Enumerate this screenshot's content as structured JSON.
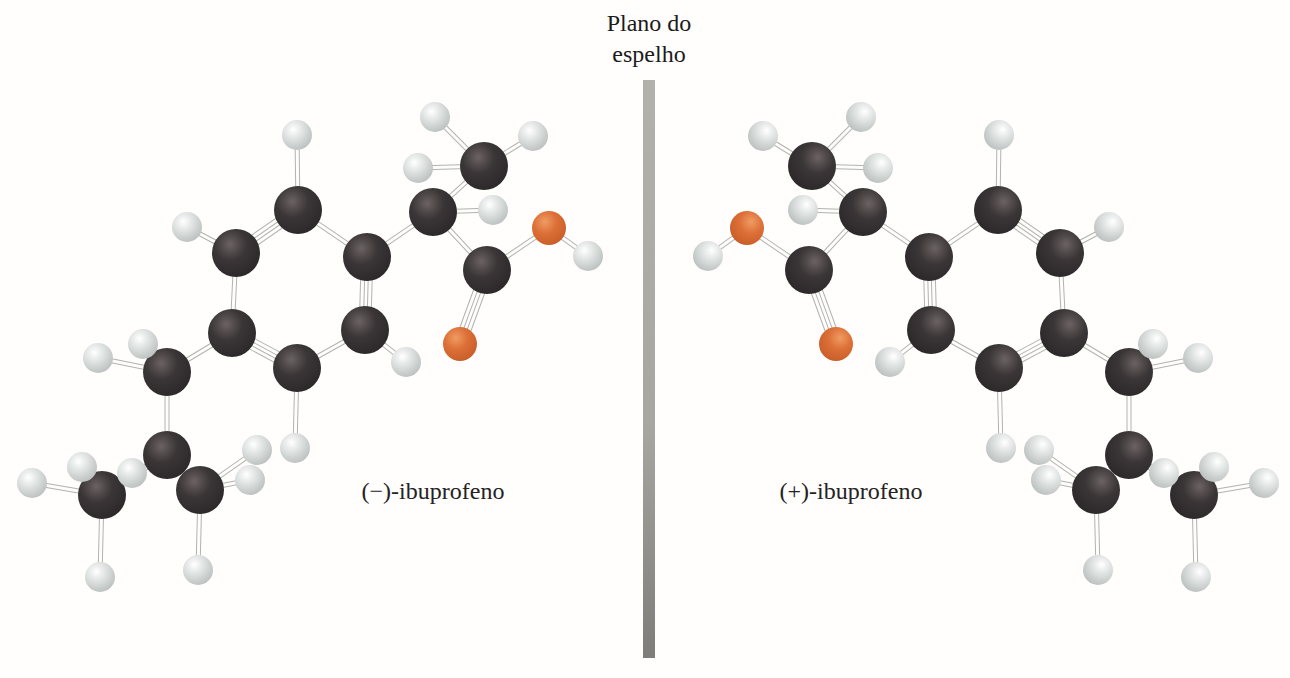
{
  "title": {
    "line1": "Plano do",
    "line2": "espelho"
  },
  "labels": {
    "left": "(−)-ibuprofeno",
    "right": "(+)-ibuprofeno"
  },
  "palette": {
    "background": "#fffefd",
    "carbon_hi": "#6b6263",
    "carbon_mid": "#3a3536",
    "carbon_edge": "#2b2728",
    "hydrogen_hi": "#ffffff",
    "hydrogen_mid": "#dde1e0",
    "hydrogen_edge": "#b8bebd",
    "oxygen_hi": "#ef9c63",
    "oxygen_mid": "#dd7038",
    "oxygen_edge": "#c75c27",
    "bond_outline": "#b2b2ae",
    "bond_fill": "#fdfdfc",
    "bar_top": "#b2b2ad",
    "bar_mid": "#a7a7a2",
    "bar_bottom": "#7d7d79",
    "text": "#1c1a1a"
  },
  "mirror_bar": {
    "x": 643,
    "y_top": 80,
    "y_bottom": 658,
    "width": 12
  },
  "mirror_axis_x": 648,
  "molecule": {
    "name": "ibuprofeno",
    "radii": {
      "C": 24,
      "H": 15,
      "O": 17
    },
    "atoms": [
      {
        "id": "C1",
        "el": "C",
        "x": 298,
        "y": 210
      },
      {
        "id": "C2",
        "el": "C",
        "x": 236,
        "y": 253
      },
      {
        "id": "C3",
        "el": "C",
        "x": 232,
        "y": 333
      },
      {
        "id": "C4",
        "el": "C",
        "x": 297,
        "y": 368
      },
      {
        "id": "C5",
        "el": "C",
        "x": 365,
        "y": 330
      },
      {
        "id": "C6",
        "el": "C",
        "x": 367,
        "y": 257
      },
      {
        "id": "C7",
        "el": "C",
        "x": 433,
        "y": 212
      },
      {
        "id": "C8",
        "el": "C",
        "x": 484,
        "y": 166
      },
      {
        "id": "C9",
        "el": "C",
        "x": 487,
        "y": 270
      },
      {
        "id": "C10",
        "el": "C",
        "x": 167,
        "y": 372
      },
      {
        "id": "C11",
        "el": "C",
        "x": 167,
        "y": 455
      },
      {
        "id": "C12",
        "el": "C",
        "x": 102,
        "y": 495
      },
      {
        "id": "C13",
        "el": "C",
        "x": 200,
        "y": 490
      },
      {
        "id": "O1",
        "el": "O",
        "x": 549,
        "y": 228
      },
      {
        "id": "O2",
        "el": "O",
        "x": 460,
        "y": 344
      },
      {
        "id": "H1",
        "el": "H",
        "x": 297,
        "y": 135
      },
      {
        "id": "H2",
        "el": "H",
        "x": 187,
        "y": 227
      },
      {
        "id": "H3",
        "el": "H",
        "x": 295,
        "y": 448
      },
      {
        "id": "H4",
        "el": "H",
        "x": 406,
        "y": 362
      },
      {
        "id": "H5",
        "el": "H",
        "x": 493,
        "y": 210
      },
      {
        "id": "H6",
        "el": "H",
        "x": 435,
        "y": 117
      },
      {
        "id": "H7",
        "el": "H",
        "x": 533,
        "y": 136
      },
      {
        "id": "H8",
        "el": "H",
        "x": 418,
        "y": 168
      },
      {
        "id": "H9",
        "el": "H",
        "x": 588,
        "y": 256
      },
      {
        "id": "H10",
        "el": "H",
        "x": 143,
        "y": 344
      },
      {
        "id": "H11",
        "el": "H",
        "x": 98,
        "y": 358
      },
      {
        "id": "H12",
        "el": "H",
        "x": 132,
        "y": 473
      },
      {
        "id": "H13",
        "el": "H",
        "x": 82,
        "y": 467
      },
      {
        "id": "H14",
        "el": "H",
        "x": 32,
        "y": 483
      },
      {
        "id": "H15",
        "el": "H",
        "x": 100,
        "y": 577
      },
      {
        "id": "H16",
        "el": "H",
        "x": 257,
        "y": 450
      },
      {
        "id": "H17",
        "el": "H",
        "x": 250,
        "y": 480
      },
      {
        "id": "H18",
        "el": "H",
        "x": 198,
        "y": 570
      }
    ],
    "bonds": [
      {
        "a": "C1",
        "b": "C2",
        "order": 2
      },
      {
        "a": "C2",
        "b": "C3",
        "order": 1
      },
      {
        "a": "C3",
        "b": "C4",
        "order": 2
      },
      {
        "a": "C4",
        "b": "C5",
        "order": 1
      },
      {
        "a": "C5",
        "b": "C6",
        "order": 2
      },
      {
        "a": "C6",
        "b": "C1",
        "order": 1
      },
      {
        "a": "C1",
        "b": "H1",
        "order": 1
      },
      {
        "a": "C2",
        "b": "H2",
        "order": 1
      },
      {
        "a": "C4",
        "b": "H3",
        "order": 1
      },
      {
        "a": "C5",
        "b": "H4",
        "order": 1
      },
      {
        "a": "C6",
        "b": "C7",
        "order": 1
      },
      {
        "a": "C7",
        "b": "C8",
        "order": 1
      },
      {
        "a": "C7",
        "b": "H5",
        "order": 1
      },
      {
        "a": "C7",
        "b": "C9",
        "order": 1
      },
      {
        "a": "C8",
        "b": "H6",
        "order": 1
      },
      {
        "a": "C8",
        "b": "H7",
        "order": 1
      },
      {
        "a": "C8",
        "b": "H8",
        "order": 1
      },
      {
        "a": "C9",
        "b": "O2",
        "order": 2
      },
      {
        "a": "C9",
        "b": "O1",
        "order": 1
      },
      {
        "a": "O1",
        "b": "H9",
        "order": 1
      },
      {
        "a": "C3",
        "b": "C10",
        "order": 1
      },
      {
        "a": "C10",
        "b": "H10",
        "order": 1
      },
      {
        "a": "C10",
        "b": "H11",
        "order": 1
      },
      {
        "a": "C10",
        "b": "C11",
        "order": 1
      },
      {
        "a": "C11",
        "b": "H12",
        "order": 1
      },
      {
        "a": "C11",
        "b": "C12",
        "order": 1
      },
      {
        "a": "C11",
        "b": "C13",
        "order": 1
      },
      {
        "a": "C12",
        "b": "H13",
        "order": 1
      },
      {
        "a": "C12",
        "b": "H14",
        "order": 1
      },
      {
        "a": "C12",
        "b": "H15",
        "order": 1
      },
      {
        "a": "C13",
        "b": "H16",
        "order": 1
      },
      {
        "a": "C13",
        "b": "H17",
        "order": 1
      },
      {
        "a": "C13",
        "b": "H18",
        "order": 1
      }
    ]
  }
}
